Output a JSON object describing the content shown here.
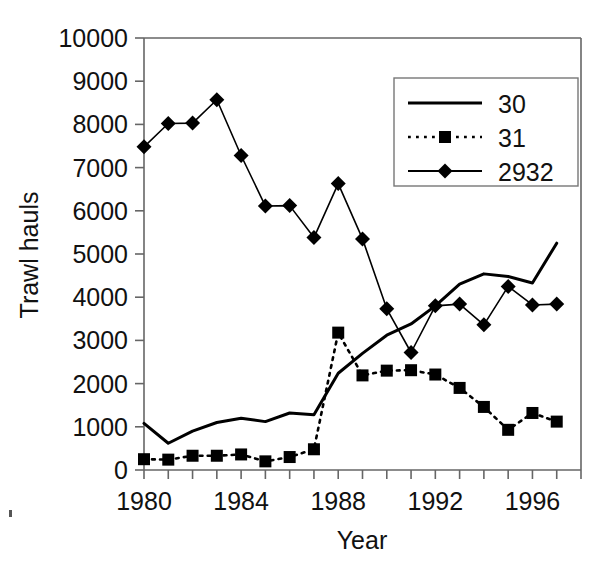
{
  "figure": {
    "background_color": "#ffffff",
    "ink_color": "#000000",
    "axis_color": "#666666"
  },
  "chart_data": {
    "type": "line",
    "title": "",
    "xlabel": "Year",
    "ylabel": "Trawl hauls",
    "xlim": [
      1980,
      1998
    ],
    "ylim": [
      0,
      10000
    ],
    "grid": false,
    "legend_position": "top-right",
    "xticks": [
      1980,
      1984,
      1988,
      1992,
      1996
    ],
    "xtick_labels": [
      "1980",
      "1984",
      "1988",
      "1992",
      "1996"
    ],
    "xticks_minor_step": 1,
    "yticks": [
      0,
      1000,
      2000,
      3000,
      4000,
      5000,
      6000,
      7000,
      8000,
      9000,
      10000
    ],
    "ytick_labels": [
      "0",
      "1000",
      "2000",
      "3000",
      "4000",
      "5000",
      "6000",
      "7000",
      "8000",
      "9000",
      "10000"
    ],
    "x": [
      1980,
      1981,
      1982,
      1983,
      1984,
      1985,
      1986,
      1987,
      1988,
      1989,
      1990,
      1991,
      1992,
      1993,
      1994,
      1995,
      1996,
      1997
    ],
    "series": [
      {
        "name": "30",
        "label": "30",
        "style": "solid",
        "marker": "none",
        "line_width": 3.0,
        "color": "#000000",
        "values": [
          1080,
          620,
          900,
          1100,
          1200,
          1120,
          1320,
          1280,
          2240,
          2700,
          3120,
          3380,
          3800,
          4300,
          4540,
          4480,
          4330,
          5250
        ]
      },
      {
        "name": "31",
        "label": "31",
        "style": "dotted",
        "marker": "square",
        "line_width": 2.6,
        "color": "#000000",
        "values": [
          250,
          240,
          330,
          330,
          360,
          200,
          300,
          480,
          3180,
          2190,
          2300,
          2310,
          2210,
          1900,
          1460,
          930,
          1320,
          1120
        ]
      },
      {
        "name": "2932",
        "label": "2932",
        "style": "solid",
        "marker": "diamond",
        "line_width": 1.6,
        "color": "#000000",
        "values": [
          7480,
          8020,
          8030,
          8570,
          7280,
          6110,
          6120,
          5380,
          6630,
          5350,
          3730,
          2720,
          3800,
          3840,
          3360,
          4250,
          3820,
          3840
        ]
      }
    ]
  },
  "legend": {
    "entries": [
      {
        "label": "30",
        "style": "solid",
        "marker": "none"
      },
      {
        "label": "31",
        "style": "dotted",
        "marker": "square"
      },
      {
        "label": "2932",
        "style": "solid",
        "marker": "diamond"
      }
    ]
  }
}
